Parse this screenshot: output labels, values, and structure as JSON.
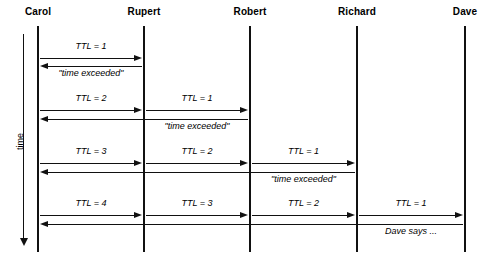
{
  "diagram": {
    "type": "sequence-diagram",
    "title": "",
    "time_axis": {
      "label": "time",
      "direction": "downward"
    },
    "actors": [
      {
        "id": "carol",
        "name": "Carol",
        "x": 38
      },
      {
        "id": "rupert",
        "name": "Rupert",
        "x": 144
      },
      {
        "id": "robert",
        "name": "Robert",
        "x": 250
      },
      {
        "id": "richard",
        "name": "Richard",
        "x": 357
      },
      {
        "id": "dave",
        "name": "Dave",
        "x": 465
      }
    ],
    "rounds": [
      {
        "round": 1,
        "forward": [
          {
            "label": "TTL = 1",
            "from": "carol",
            "to": "rupert"
          }
        ],
        "reply": {
          "label": "\"time exceeded\"",
          "from": "rupert",
          "to": "carol"
        }
      },
      {
        "round": 2,
        "forward": [
          {
            "label": "TTL = 2",
            "from": "carol",
            "to": "rupert"
          },
          {
            "label": "TTL = 1",
            "from": "rupert",
            "to": "robert"
          }
        ],
        "reply": {
          "label": "\"time exceeded\"",
          "from": "robert",
          "to": "carol"
        }
      },
      {
        "round": 3,
        "forward": [
          {
            "label": "TTL = 3",
            "from": "carol",
            "to": "rupert"
          },
          {
            "label": "TTL = 2",
            "from": "rupert",
            "to": "robert"
          },
          {
            "label": "TTL = 1",
            "from": "robert",
            "to": "richard"
          }
        ],
        "reply": {
          "label": "\"time exceeded\"",
          "from": "richard",
          "to": "carol"
        }
      },
      {
        "round": 4,
        "forward": [
          {
            "label": "TTL = 4",
            "from": "carol",
            "to": "rupert"
          },
          {
            "label": "TTL = 3",
            "from": "rupert",
            "to": "robert"
          },
          {
            "label": "TTL = 2",
            "from": "robert",
            "to": "richard"
          },
          {
            "label": "TTL = 1",
            "from": "richard",
            "to": "dave"
          }
        ],
        "reply": {
          "label": "Dave says ...",
          "from": "dave",
          "to": "carol"
        }
      }
    ],
    "colors": {
      "ink": "#111111",
      "background": "#ffffff"
    }
  }
}
